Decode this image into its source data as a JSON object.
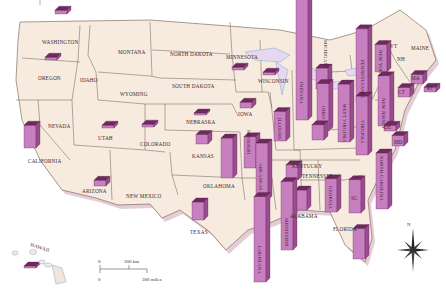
{
  "map": {
    "title": "United States 3D bar map",
    "bar_color": "#c77fc0",
    "bar_top_color": "#6e2a5c",
    "bar_side_color": "#9a4d8c",
    "land_color": "#f7ebe0",
    "border_color": "#6b5a4a",
    "water_color": "#7aa9d6",
    "shadow_color": "#d8b8c8",
    "compass_label": "N",
    "hawaii_label": "HAWAII",
    "scale": {
      "zero_top": "0",
      "km_label": "300 km",
      "zero_bottom": "0",
      "miles_label": "300 miles"
    }
  },
  "states": [
    {
      "name": "WASHINGTON",
      "label_vertical": false,
      "relative_value": 0.4
    },
    {
      "name": "OREGON",
      "label_vertical": false,
      "relative_value": 0.3
    },
    {
      "name": "IDAHO",
      "label_vertical": false,
      "relative_value": null
    },
    {
      "name": "MONTANA",
      "label_vertical": false,
      "relative_value": null
    },
    {
      "name": "WYOMING",
      "label_vertical": false,
      "relative_value": null
    },
    {
      "name": "NORTH DAKOTA",
      "label_vertical": false,
      "relative_value": null
    },
    {
      "name": "SOUTH DAKOTA",
      "label_vertical": false,
      "relative_value": null
    },
    {
      "name": "MINNESOTA",
      "label_vertical": false,
      "relative_value": 0.3
    },
    {
      "name": "WISCONSIN",
      "label_vertical": false,
      "relative_value": 0.3
    },
    {
      "name": "NEVADA",
      "label_vertical": false,
      "relative_value": null
    },
    {
      "name": "UTAH",
      "label_vertical": false,
      "relative_value": 0.3
    },
    {
      "name": "COLORADO",
      "label_vertical": false,
      "relative_value": 0.3
    },
    {
      "name": "NEBRASKA",
      "label_vertical": false,
      "relative_value": 0.2
    },
    {
      "name": "IOWA",
      "label_vertical": false,
      "relative_value": 0.6
    },
    {
      "name": "KANSAS",
      "label_vertical": false,
      "relative_value": 1.0
    },
    {
      "name": "CALIFORNIA",
      "label_vertical": false,
      "relative_value": 2.4
    },
    {
      "name": "ARIZONA",
      "label_vertical": false,
      "relative_value": 0.6
    },
    {
      "name": "NEW MEXICO",
      "label_vertical": false,
      "relative_value": null
    },
    {
      "name": "OKLAHOMA",
      "label_vertical": false,
      "relative_value": 4.2
    },
    {
      "name": "TEXAS",
      "label_vertical": false,
      "relative_value": 1.9
    },
    {
      "name": "MISSOURI",
      "label_vertical": true,
      "relative_value": 3.3
    },
    {
      "name": "ARKANSAS",
      "label_vertical": true,
      "relative_value": 6.0
    },
    {
      "name": "LOUISIANA",
      "label_vertical": true,
      "relative_value": 9.0
    },
    {
      "name": "MISSISSIPPI",
      "label_vertical": true,
      "relative_value": 7.2
    },
    {
      "name": "ILLINOIS",
      "label_vertical": true,
      "relative_value": 3.1
    },
    {
      "name": "INDIANA",
      "label_vertical": true,
      "relative_value": 13.0
    },
    {
      "name": "MICHIGAN",
      "label_vertical": true,
      "relative_value": 2.2
    },
    {
      "name": "OHIO",
      "label_vertical": true,
      "relative_value": 5.0
    },
    {
      "name": "KENTUCKY",
      "label_vertical": false,
      "relative_value": 1.6
    },
    {
      "name": "TENNESSEE",
      "label_vertical": false,
      "relative_value": 1.6
    },
    {
      "name": "ALABAMA",
      "label_vertical": false,
      "relative_value": 2.1
    },
    {
      "name": "GEORGIA",
      "label_vertical": true,
      "relative_value": 3.5
    },
    {
      "name": "FLORIDA",
      "label_vertical": false,
      "relative_value": 3.2
    },
    {
      "name": "SC",
      "label_vertical": false,
      "relative_value": 3.5
    },
    {
      "name": "NORTH CAROLINA",
      "label_vertical": true,
      "relative_value": 5.9
    },
    {
      "name": "VIRGINIA",
      "label_vertical": true,
      "relative_value": 6.2
    },
    {
      "name": "WEST VIRGINIA",
      "label_vertical": true,
      "relative_value": 6.1
    },
    {
      "name": "PENNSYLVANIA",
      "label_vertical": true,
      "relative_value": 7.7
    },
    {
      "name": "NEW YORK",
      "label_vertical": true,
      "relative_value": 2.9
    },
    {
      "name": "NEW JERSEY",
      "label_vertical": true,
      "relative_value": 5.3
    },
    {
      "name": "VT",
      "label_vertical": false,
      "relative_value": null
    },
    {
      "name": "NH",
      "label_vertical": false,
      "relative_value": null
    },
    {
      "name": "MAINE",
      "label_vertical": false,
      "relative_value": null
    },
    {
      "name": "MA",
      "label_vertical": false,
      "relative_value": 1.0
    },
    {
      "name": "RI",
      "label_vertical": false,
      "relative_value": 0.5
    },
    {
      "name": "CT",
      "label_vertical": false,
      "relative_value": 1.0
    },
    {
      "name": "DE",
      "label_vertical": false,
      "relative_value": 0.6
    },
    {
      "name": "MD",
      "label_vertical": false,
      "relative_value": 1.1
    },
    {
      "name": "HAWAII",
      "label_vertical": false,
      "relative_value": 0.2
    }
  ]
}
